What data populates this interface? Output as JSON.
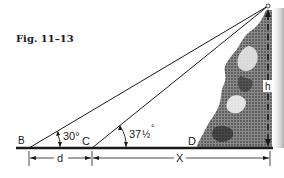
{
  "figure": {
    "title": "Fig. 11–13"
  },
  "points": {
    "B": "B",
    "C": "C",
    "D": "D"
  },
  "angles": {
    "at_B": "30°",
    "at_C_whole": "37",
    "at_C_fraction": "½",
    "at_C_degree": "°"
  },
  "dimensions": {
    "d": "d",
    "x": "X",
    "h": "h"
  },
  "colors": {
    "ink": "#1a1a1a",
    "background": "#ffffff",
    "rock_dark": "#2b2b2b",
    "rock_mid": "#6e6e6e",
    "rock_light": "#bdbdbd"
  }
}
